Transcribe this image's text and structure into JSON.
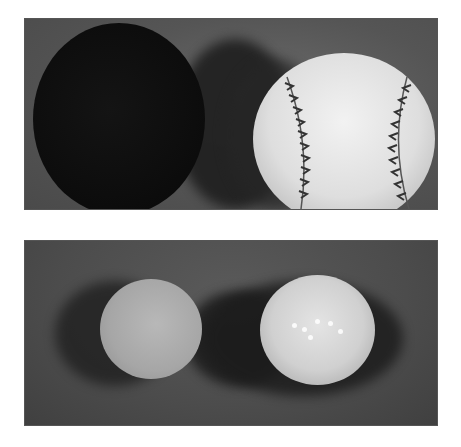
{
  "figure": {
    "panels": [
      {
        "id": "top",
        "objects": [
          "black-ball",
          "baseball"
        ]
      },
      {
        "id": "bottom",
        "objects": [
          "small-golf-ball",
          "dimpled-golf-ball"
        ]
      }
    ],
    "colors": {
      "background_top": "#555555",
      "background_bottom": "#4c4c4c",
      "divider": "#ffffff",
      "black_ball": "#0d0d0d",
      "baseball": "#e6e6e6",
      "golf_small": "#a8a8a8",
      "golf_large": "#d4d4d4"
    }
  }
}
